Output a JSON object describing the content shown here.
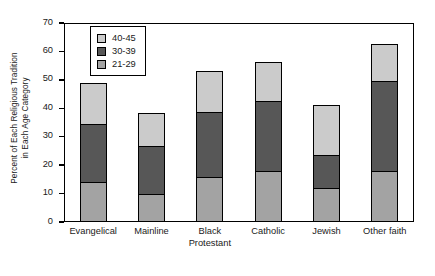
{
  "chart_data": {
    "type": "bar",
    "subtype": "stacked-vertical",
    "title": "",
    "xlabel": "",
    "ylabel_lines": [
      "Percent of Each Religious Tradition",
      "in Each Age Category"
    ],
    "ylabel": "Percent of Each Religious Tradition in Each Age Category",
    "ylim": [
      0,
      70
    ],
    "ytick_step": 10,
    "yticks": [
      70,
      60,
      50,
      40,
      30,
      20,
      10,
      0
    ],
    "ytick_labels": [
      "70",
      "60",
      "50",
      "40",
      "30",
      "20",
      "10",
      "0"
    ],
    "grid": false,
    "legend_position": "upper-left-inside",
    "categories": [
      "Evangelical",
      "Mainline",
      "Black Protestant",
      "Catholic",
      "Jewish",
      "Other faith"
    ],
    "category_lines": [
      [
        "Evangelical"
      ],
      [
        "Mainline"
      ],
      [
        "Black",
        "Protestant"
      ],
      [
        "Catholic"
      ],
      [
        "Jewish"
      ],
      [
        "Other faith"
      ]
    ],
    "series": [
      {
        "name": "21-29",
        "color": "#a3a3a3",
        "values": [
          14,
          10,
          16,
          18,
          12,
          18
        ]
      },
      {
        "name": "30-39",
        "color": "#575757",
        "values": [
          21,
          17,
          23,
          25,
          12,
          32
        ]
      },
      {
        "name": "40-45",
        "color": "#cbcbcb",
        "values": [
          14.5,
          12,
          15,
          14,
          18,
          13.5
        ]
      }
    ],
    "stack_order_bottom_to_top": [
      "21-29",
      "30-39",
      "40-45"
    ],
    "totals": [
      49.5,
      39,
      54,
      57,
      42,
      63.5
    ]
  },
  "legend": {
    "entries": [
      {
        "label": "40-45",
        "color": "#cbcbcb"
      },
      {
        "label": "30-39",
        "color": "#575757"
      },
      {
        "label": "21-29",
        "color": "#a3a3a3"
      }
    ]
  },
  "colors": {
    "axis": "#000000",
    "background": "#ffffff",
    "light_gray": "#cbcbcb",
    "dark_gray": "#575757",
    "medium_gray": "#a3a3a3"
  }
}
